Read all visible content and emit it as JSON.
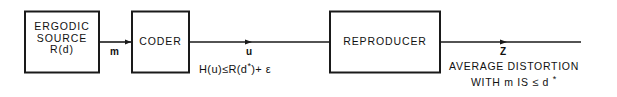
{
  "figure": {
    "type": "block-diagram",
    "background_color": "#ffffff",
    "stroke_color": "#1a1a1a"
  },
  "blocks": [
    {
      "id": "ergodic-source",
      "lines": [
        "ERGODIC",
        "SOURCE",
        "R(d)"
      ],
      "line1": "ERGODIC",
      "line2": "SOURCE",
      "line3": "R(d)"
    },
    {
      "id": "coder",
      "lines": [
        "CODER"
      ],
      "line1": "CODER"
    },
    {
      "id": "reproducer",
      "lines": [
        "REPRODUCER"
      ],
      "line1": "REPRODUCER"
    }
  ],
  "signals": [
    {
      "id": "m",
      "label": "m"
    },
    {
      "id": "u",
      "label": "u"
    },
    {
      "id": "z",
      "label": "Z"
    }
  ],
  "annotations": {
    "rate_constraint": {
      "text": "H(u) ≤ R(d*) + ε",
      "parts": {
        "lhs": "H(u)",
        "operator": "≤",
        "rhs_base": "R(d",
        "rhs_star": "*",
        "rhs_close": ")",
        "plus_epsilon": "+ ε"
      }
    },
    "distortion": {
      "line1": "AVERAGE DISTORTION",
      "line2_prefix": "WITH m IS ",
      "line2_operator": "≤",
      "line2_suffix": " d ",
      "line2_star": "*",
      "full_text": "AVERAGE DISTORTION WITH m IS ≤ d *"
    }
  }
}
